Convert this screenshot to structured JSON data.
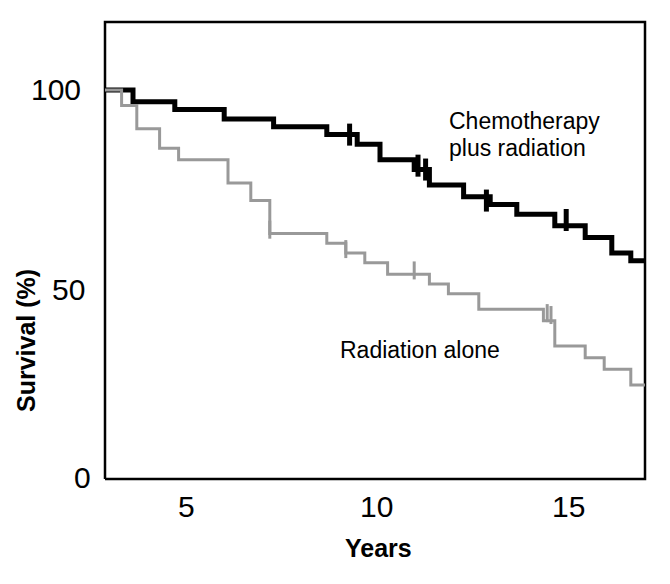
{
  "axes": {
    "y_title": "Survival (%)",
    "x_title": "Years",
    "y_ticks": [
      "100",
      "50",
      "0"
    ],
    "x_ticks": [
      "5",
      "10",
      "15"
    ]
  },
  "annotations": {
    "chemo_label": "Chemotherapy\nplus radiation",
    "radiation_label": "Radiation alone"
  },
  "colors": {
    "chemo": "#000000",
    "radiation": "#999999",
    "frame": "#000000",
    "background": "#ffffff"
  },
  "chart_data": {
    "type": "line",
    "subtype": "kaplan-meier-step",
    "title": "",
    "xlabel": "Years",
    "ylabel": "Survival (%)",
    "xlim": [
      2.5,
      17.1
    ],
    "ylim": [
      0,
      121
    ],
    "x_ticks": [
      5,
      10,
      15
    ],
    "y_ticks": [
      0,
      50,
      100
    ],
    "grid": false,
    "legend": "inline-annotations",
    "series": [
      {
        "name": "Chemotherapy plus radiation",
        "color": "#000000",
        "line_width": 5,
        "points": [
          {
            "x": 2.5,
            "y": 100
          },
          {
            "x": 3.5,
            "y": 100
          },
          {
            "x": 3.5,
            "y": 97
          },
          {
            "x": 4.6,
            "y": 97
          },
          {
            "x": 4.6,
            "y": 95
          },
          {
            "x": 5.9,
            "y": 95
          },
          {
            "x": 5.9,
            "y": 92.5
          },
          {
            "x": 7.2,
            "y": 92.5
          },
          {
            "x": 7.2,
            "y": 90.5
          },
          {
            "x": 8.6,
            "y": 90.5
          },
          {
            "x": 8.6,
            "y": 88.5
          },
          {
            "x": 9.4,
            "y": 88.5
          },
          {
            "x": 9.4,
            "y": 86
          },
          {
            "x": 10.0,
            "y": 86
          },
          {
            "x": 10.0,
            "y": 82
          },
          {
            "x": 10.9,
            "y": 82
          },
          {
            "x": 10.9,
            "y": 79.5
          },
          {
            "x": 11.3,
            "y": 79.5
          },
          {
            "x": 11.3,
            "y": 75.5
          },
          {
            "x": 12.2,
            "y": 75.5
          },
          {
            "x": 12.2,
            "y": 72.5
          },
          {
            "x": 12.9,
            "y": 72.5
          },
          {
            "x": 12.9,
            "y": 70.5
          },
          {
            "x": 13.6,
            "y": 70.5
          },
          {
            "x": 13.6,
            "y": 68
          },
          {
            "x": 14.6,
            "y": 68
          },
          {
            "x": 14.6,
            "y": 65
          },
          {
            "x": 15.4,
            "y": 65
          },
          {
            "x": 15.4,
            "y": 62
          },
          {
            "x": 16.1,
            "y": 62
          },
          {
            "x": 16.1,
            "y": 58
          },
          {
            "x": 16.6,
            "y": 58
          },
          {
            "x": 16.6,
            "y": 56
          },
          {
            "x": 17.1,
            "y": 56
          }
        ],
        "censored": [
          {
            "x": 9.2,
            "y": 88.5
          },
          {
            "x": 11.0,
            "y": 80.5
          },
          {
            "x": 11.2,
            "y": 79.5
          },
          {
            "x": 12.8,
            "y": 71.5
          },
          {
            "x": 14.9,
            "y": 66.5
          }
        ],
        "start_value": 100,
        "end_value": 56
      },
      {
        "name": "Radiation alone",
        "color": "#999999",
        "line_width": 3,
        "points": [
          {
            "x": 2.5,
            "y": 100
          },
          {
            "x": 3.2,
            "y": 100
          },
          {
            "x": 3.2,
            "y": 96
          },
          {
            "x": 3.6,
            "y": 96
          },
          {
            "x": 3.6,
            "y": 90
          },
          {
            "x": 4.2,
            "y": 90
          },
          {
            "x": 4.2,
            "y": 85
          },
          {
            "x": 4.7,
            "y": 85
          },
          {
            "x": 4.7,
            "y": 82
          },
          {
            "x": 6.0,
            "y": 82
          },
          {
            "x": 6.0,
            "y": 76
          },
          {
            "x": 6.6,
            "y": 76
          },
          {
            "x": 6.6,
            "y": 71.5
          },
          {
            "x": 7.1,
            "y": 71.5
          },
          {
            "x": 7.1,
            "y": 63
          },
          {
            "x": 8.6,
            "y": 63
          },
          {
            "x": 8.6,
            "y": 60.5
          },
          {
            "x": 9.1,
            "y": 60.5
          },
          {
            "x": 9.1,
            "y": 58
          },
          {
            "x": 9.6,
            "y": 58
          },
          {
            "x": 9.6,
            "y": 55.5
          },
          {
            "x": 10.2,
            "y": 55.5
          },
          {
            "x": 10.2,
            "y": 52.5
          },
          {
            "x": 11.3,
            "y": 52.5
          },
          {
            "x": 11.3,
            "y": 50
          },
          {
            "x": 11.8,
            "y": 50
          },
          {
            "x": 11.8,
            "y": 47.5
          },
          {
            "x": 12.6,
            "y": 47.5
          },
          {
            "x": 12.6,
            "y": 43.5
          },
          {
            "x": 14.3,
            "y": 43.5
          },
          {
            "x": 14.3,
            "y": 40.5
          },
          {
            "x": 14.6,
            "y": 40.5
          },
          {
            "x": 14.6,
            "y": 34
          },
          {
            "x": 15.4,
            "y": 34
          },
          {
            "x": 15.4,
            "y": 31
          },
          {
            "x": 15.9,
            "y": 31
          },
          {
            "x": 15.9,
            "y": 28
          },
          {
            "x": 16.6,
            "y": 28
          },
          {
            "x": 16.6,
            "y": 24
          },
          {
            "x": 17.1,
            "y": 24
          }
        ],
        "censored": [
          {
            "x": 7.1,
            "y": 64
          },
          {
            "x": 9.1,
            "y": 59
          },
          {
            "x": 10.9,
            "y": 53.5
          },
          {
            "x": 14.4,
            "y": 42.5
          },
          {
            "x": 14.5,
            "y": 42
          }
        ],
        "start_value": 100,
        "end_value": 24
      }
    ]
  }
}
